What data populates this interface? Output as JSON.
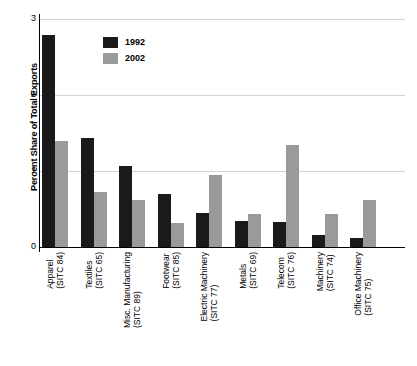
{
  "chart_data": {
    "type": "bar",
    "title": "",
    "xlabel": "",
    "ylabel": "Percent Share of Total Exports",
    "ylim": [
      0,
      3
    ],
    "yticks": [
      0,
      1,
      2,
      3
    ],
    "ytick_labels": [
      "0",
      "1",
      "2",
      "3"
    ],
    "grid": true,
    "legend_position": "top-left-inside",
    "categories": [
      "Apparel (SITC 84)",
      "Textiles (SITC 65)",
      "Misc. Manufacturing (SITC 89)",
      "Footwear (SITC 85)",
      "Electric Machinery (SITC 77)",
      "Metals (SITC 69)",
      "Telecom (SITC 76)",
      "Machinery (SITC 74)",
      "Office Machinery (SITC 75)"
    ],
    "category_lines": [
      [
        "Apparel",
        "(SITC 84)"
      ],
      [
        "Textiles",
        "(SITC 65)"
      ],
      [
        "Misc. Manufacturing",
        "(SITC 89)"
      ],
      [
        "Footwear",
        "(SITC 85)"
      ],
      [
        "Electric Machinery",
        "(SITC 77)"
      ],
      [
        "Metals",
        "(SITC 69)"
      ],
      [
        "Telecom",
        "(SITC 76)"
      ],
      [
        "Machinery",
        "(SITC 74)"
      ],
      [
        "Office Machinery",
        "(SITC 75)"
      ]
    ],
    "series": [
      {
        "name": "1992",
        "color": "#1a1a1a",
        "values": [
          2.79,
          1.43,
          1.07,
          0.7,
          0.45,
          0.34,
          0.33,
          0.16,
          0.12
        ]
      },
      {
        "name": "2002",
        "color": "#9a9a9a",
        "values": [
          1.39,
          0.72,
          0.62,
          0.32,
          0.95,
          0.44,
          1.34,
          0.43,
          0.62
        ]
      }
    ]
  },
  "legend": {
    "items": [
      {
        "label": "1992",
        "color": "#1a1a1a"
      },
      {
        "label": "2002",
        "color": "#9a9a9a"
      }
    ]
  }
}
